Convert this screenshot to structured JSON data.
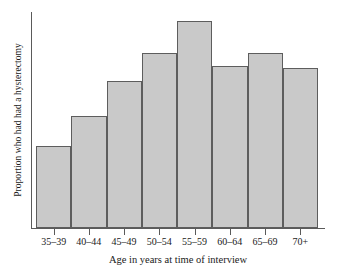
{
  "chart_data": {
    "type": "bar",
    "title": "",
    "subtitle": "",
    "xlabel": "Age in years at time of interview",
    "ylabel": "Proportion who had had a hysterectomy",
    "categories": [
      "35–39",
      "40–44",
      "45–49",
      "50–54",
      "55–59",
      "60–64",
      "65–69",
      "70+"
    ],
    "values": [
      0.38,
      0.52,
      0.68,
      0.81,
      0.96,
      0.75,
      0.81,
      0.74
    ],
    "series": [
      {
        "name": "Proportion who had had a hysterectomy",
        "values": [
          0.38,
          0.52,
          0.68,
          0.81,
          0.96,
          0.75,
          0.81,
          0.74
        ]
      }
    ],
    "ylim": [
      0,
      1
    ],
    "xlim": [
      0,
      8
    ],
    "grid": false,
    "legend": false,
    "legend_position": "none",
    "y_tick_labels": [],
    "x_tick_labels": [
      "35–39",
      "40–44",
      "45–49",
      "50–54",
      "55–59",
      "60–64",
      "65–69",
      "70+"
    ],
    "annotations": [],
    "bar_fill_color": "#c9c9c9",
    "bar_edge_color": "#5d5d5d",
    "axis_color": "#5a5a5a",
    "background_color": "#ffffff",
    "text_color": "#1a1a1a"
  },
  "axes": {
    "y_title": "Proportion who had had a hysterectomy",
    "x_title": "Age in years at time of interview"
  }
}
